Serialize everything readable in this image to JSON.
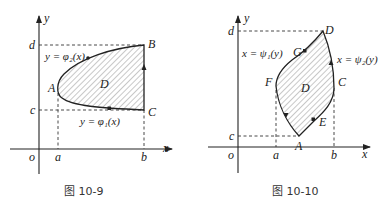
{
  "figures": [
    {
      "caption": "图 10-9",
      "axes": {
        "x_label": "x",
        "y_label": "y",
        "origin_label": "o"
      },
      "ticks": {
        "x": [
          "a",
          "b"
        ],
        "y": [
          "c",
          "d"
        ]
      },
      "points": {
        "A": "A",
        "B": "B",
        "C": "C"
      },
      "region_label": "D",
      "curves": {
        "upper": "y = φ₂(x)",
        "lower": "y = φ₁(x)"
      }
    },
    {
      "caption": "图 10-10",
      "axes": {
        "x_label": "x",
        "y_label": "y",
        "origin_label": "o"
      },
      "ticks": {
        "x": [
          "a",
          "b"
        ],
        "y": [
          "c",
          "d"
        ]
      },
      "points": {
        "A": "A",
        "C": "C",
        "D": "D",
        "E": "E",
        "F": "F",
        "G": "G"
      },
      "region_label": "D",
      "curves": {
        "left": "x = ψ₁(y)",
        "right": "x = ψ₂(y)"
      }
    }
  ]
}
